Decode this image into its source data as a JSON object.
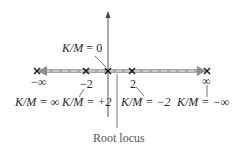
{
  "diagram": {
    "type": "root-locus",
    "axis": {
      "horizontal": {
        "from_x": 37,
        "to_x": 207,
        "y": 71
      },
      "vertical": {
        "x": 108,
        "top_y": 12,
        "bottom_y": 117
      }
    },
    "locus_band_color": "#9a9a9a",
    "axis_color": "#555555",
    "points": [
      {
        "id": "neg-inf",
        "value_label": "−∞",
        "km_label": "K/M = ∞"
      },
      {
        "id": "neg-two",
        "value_label": "−2",
        "km_label": "K/M = +2"
      },
      {
        "id": "origin",
        "value_label": "",
        "km_label": "K/M = 0"
      },
      {
        "id": "pos-two",
        "value_label": "2",
        "km_label": "K/M = −2"
      },
      {
        "id": "pos-inf",
        "value_label": "∞",
        "km_label": "K/M = −∞"
      }
    ],
    "caption": "Root locus"
  }
}
